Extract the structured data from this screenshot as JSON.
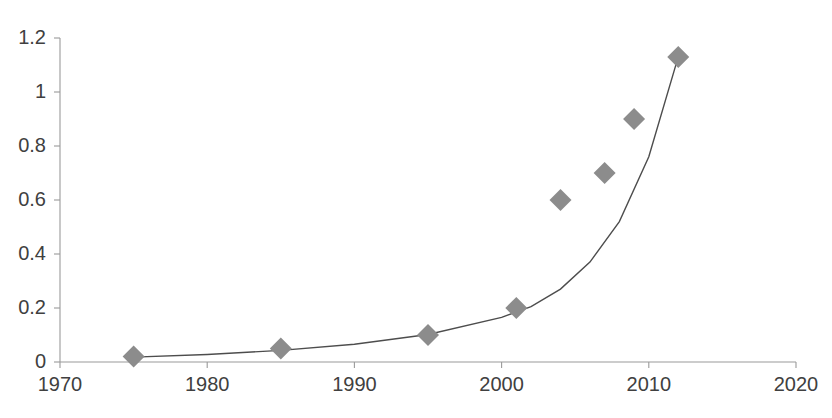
{
  "chart_data": {
    "type": "scatter",
    "title": "",
    "subtitle": "",
    "xlabel": "",
    "ylabel": "",
    "xlim": [
      1970,
      2020
    ],
    "ylim": [
      0,
      1.2
    ],
    "grid": false,
    "legend": null,
    "legend_position": "none",
    "x_ticks": [
      "1970",
      "1980",
      "1990",
      "2000",
      "2010",
      "2020"
    ],
    "x_tick_values": [
      1970,
      1980,
      1990,
      2000,
      2010,
      2020
    ],
    "y_ticks": [
      "0",
      "0.2",
      "0.4",
      "0.6",
      "0.8",
      "1",
      "1.2"
    ],
    "y_tick_values": [
      0,
      0.2,
      0.4,
      0.6,
      0.8,
      1,
      1.2
    ],
    "marker_shape": "diamond",
    "marker_color": "#8c8c8c",
    "line_color": "#4d4d4d",
    "axis_color": "#9a9a9a",
    "tick_label_color": "#404040",
    "series": [
      {
        "name": "data points",
        "type": "scatter",
        "x": [
          1975,
          1985,
          1995,
          2001,
          2004,
          2007,
          2009,
          2012
        ],
        "y": [
          0.02,
          0.05,
          0.1,
          0.2,
          0.6,
          0.7,
          0.9,
          1.13
        ]
      },
      {
        "name": "exponential fit",
        "type": "line",
        "x": [
          1975,
          1980,
          1985,
          1990,
          1995,
          2000,
          2002,
          2004,
          2006,
          2008,
          2010,
          2012
        ],
        "y": [
          0.018,
          0.028,
          0.043,
          0.066,
          0.102,
          0.165,
          0.205,
          0.27,
          0.37,
          0.52,
          0.76,
          1.13
        ]
      }
    ]
  },
  "geometry": {
    "plot_left": 60,
    "plot_right": 796,
    "plot_top": 38,
    "plot_bottom": 362,
    "tick_length": 6,
    "marker_half_size": 11
  }
}
